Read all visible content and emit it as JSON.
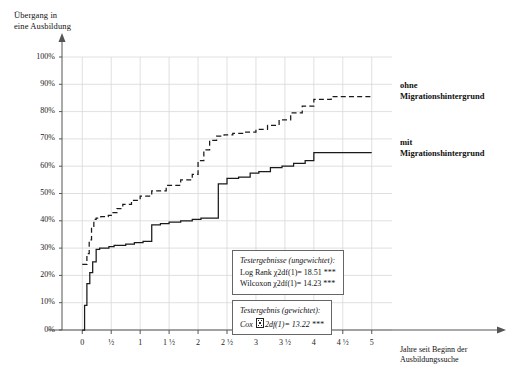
{
  "chart_data": {
    "type": "line",
    "title": "",
    "ylabel": "Übergang in\neine Ausbildung",
    "xlabel": "Jahre seit Beginn der\nAusbildungssuche",
    "ylim": [
      0,
      100
    ],
    "xlim": [
      -0.35,
      5.35
    ],
    "grid": true,
    "legend_position": "right-inline",
    "ytick_labels": [
      "0%",
      "10%",
      "20%",
      "30%",
      "40%",
      "50%",
      "60%",
      "70%",
      "80%",
      "90%",
      "100%"
    ],
    "ytick_values": [
      0,
      10,
      20,
      30,
      40,
      50,
      60,
      70,
      80,
      90,
      100
    ],
    "xtick_labels": [
      "0",
      "½",
      "1",
      "1 ½",
      "2",
      "2 ½",
      "3",
      "3 ½",
      "4",
      "4 ½",
      "5"
    ],
    "xtick_values": [
      0,
      0.5,
      1,
      1.5,
      2,
      2.5,
      3,
      3.5,
      4,
      4.5,
      5
    ],
    "series": [
      {
        "name": "ohne Migrationshintergrund",
        "style": "dashed",
        "color": "#1a1a1a",
        "x": [
          0.0,
          0.05,
          0.08,
          0.12,
          0.16,
          0.2,
          0.24,
          0.28,
          0.32,
          0.38,
          0.45,
          0.52,
          0.6,
          0.7,
          0.85,
          1.0,
          1.2,
          1.45,
          1.7,
          1.9,
          2.0,
          2.1,
          2.2,
          2.32,
          2.45,
          2.6,
          2.8,
          3.0,
          3.2,
          3.4,
          3.6,
          3.8,
          4.0,
          4.3,
          5.0
        ],
        "y": [
          24.0,
          24.0,
          28.0,
          33.0,
          38.0,
          40.5,
          41.0,
          41.0,
          41.5,
          41.5,
          42.0,
          43.0,
          44.5,
          46.0,
          47.5,
          49.0,
          51.0,
          53.0,
          55.0,
          57.0,
          62.0,
          66.0,
          69.5,
          71.0,
          71.5,
          72.0,
          72.5,
          73.5,
          75.0,
          77.0,
          79.5,
          82.0,
          84.5,
          85.5,
          85.5
        ]
      },
      {
        "name": "mit Migrationshintergrund",
        "style": "solid",
        "color": "#1a1a1a",
        "x": [
          0.0,
          0.04,
          0.08,
          0.13,
          0.18,
          0.24,
          0.3,
          0.38,
          0.46,
          0.55,
          0.65,
          0.75,
          0.9,
          1.05,
          1.2,
          1.35,
          1.5,
          1.7,
          1.9,
          2.05,
          2.2,
          2.35,
          2.5,
          2.7,
          2.9,
          3.05,
          3.25,
          3.45,
          3.65,
          3.85,
          4.0,
          4.2,
          5.0
        ],
        "y": [
          0.0,
          9.0,
          17.0,
          21.0,
          25.0,
          29.5,
          30.0,
          30.0,
          30.5,
          31.0,
          31.0,
          31.5,
          32.0,
          32.5,
          38.5,
          39.0,
          39.5,
          40.0,
          40.5,
          41.0,
          41.0,
          53.5,
          55.5,
          56.0,
          57.5,
          58.0,
          59.5,
          60.0,
          61.0,
          62.0,
          65.0,
          65.0,
          65.0
        ]
      }
    ],
    "annotations": [
      {
        "id": "unweighted",
        "title": "Testergebnisse (ungewichtet):",
        "lines": [
          "Log Rank χ2df(1)= 18.51 ***",
          "Wilcoxon χ2df(1)= 14.23 ***"
        ]
      },
      {
        "id": "weighted",
        "title": "Testergebnis (gewichtet):",
        "lines": [
          "Cox ▯2df(1)= 13.22 ***"
        ]
      }
    ]
  },
  "labels": {
    "y_axis_title": "Übergang in\neine Ausbildung",
    "x_axis_title": "Jahre seit Beginn der\nAusbildungssuche",
    "series_ohne": "ohne\nMigrationshintergrund",
    "series_mit": "mit\nMigrationshintergrund"
  },
  "annotations": {
    "unweighted": {
      "title": "Testergebnisse (ungewichtet):",
      "line1": "Log Rank χ2df(1)= 18.51 ***",
      "line2": "Wilcoxon χ2df(1)= 14.23 ***"
    },
    "weighted": {
      "title": "Testergebnis (gewichtet):",
      "cox_prefix": "Cox ",
      "cox_suffix": "2df(1)= 13.22 ***"
    }
  },
  "colors": {
    "axis": "#555555",
    "grid": "#d8d8d8",
    "curve": "#1a1a1a",
    "text": "#111111"
  }
}
